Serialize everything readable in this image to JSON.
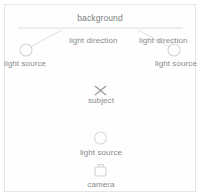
{
  "diagram": {
    "background_label": "background",
    "labels": {
      "light_direction_left": "light direction",
      "light_direction_right": "light direction",
      "light_source_left": "light source",
      "light_source_right": "light source",
      "subject": "subject",
      "light_source_bottom": "light source",
      "camera": "camera"
    },
    "colors": {
      "stroke": "#cfcfcf",
      "text": "#8a8a8a",
      "subject_marker": "#8f8f8f",
      "background_line": "#dcdcdc",
      "frame": "#e6e6e6",
      "canvas": "#ffffff"
    },
    "elements": {
      "background_line": "horizontal-rule",
      "light_source_left_icon": "circle-outline",
      "light_source_right_icon": "circle-outline",
      "light_source_bottom_icon": "circle-outline",
      "subject_icon": "x-marker",
      "camera_icon": "camera-outline",
      "light_direction_left_icon": "diagonal-line",
      "light_direction_right_icon": "diagonal-line"
    }
  }
}
